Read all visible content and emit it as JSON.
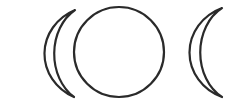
{
  "figure": {
    "parts": [
      "waxing crescent",
      "full moon",
      "waning crescent"
    ],
    "stroke_color": "#2a2a2a",
    "fill_color": "#ffffff",
    "background": "#ffffff"
  }
}
